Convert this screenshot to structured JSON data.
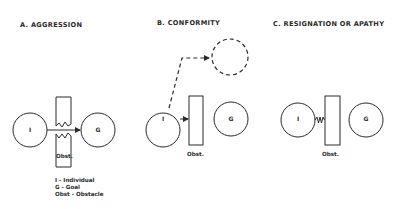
{
  "panels": [
    {
      "id": "A",
      "title": "A.  AGGRESSION",
      "individual_label": "I",
      "goal_label": "G",
      "obstacle_label": "Obst."
    },
    {
      "id": "B",
      "title": "B.  CONFORMITY",
      "individual_label": "I",
      "goal_label": "G",
      "obstacle_label": "Obst."
    },
    {
      "id": "C",
      "title": "C.  RESIGNATION OR APATHY",
      "individual_label": "I",
      "goal_label": "G",
      "obstacle_label": "Obst."
    }
  ],
  "legend": {
    "items": [
      "I - Individual",
      "G - Goal",
      "Obst - Obstacle"
    ]
  },
  "colors": {
    "stroke": "#2a2a2a",
    "background": "#ffffff"
  }
}
